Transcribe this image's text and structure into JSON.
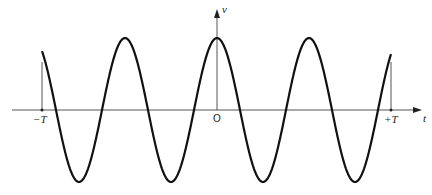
{
  "diagram": {
    "type": "waveform",
    "axes": {
      "horizontal_label": "t",
      "vertical_label": "v",
      "origin_label": "O",
      "left_limit_label": "−T",
      "right_limit_label": "+T"
    },
    "colors": {
      "stroke": "#111111",
      "axis": "#555555",
      "background": "#ffffff"
    },
    "geometry": {
      "axis_y": 110,
      "axis_x_start": 12,
      "axis_x_end": 422,
      "origin_x": 217,
      "vaxis_top": 10,
      "neg_T_x": 42,
      "pos_T_x": 391,
      "amplitude_px": 72,
      "period_px": 92
    }
  }
}
